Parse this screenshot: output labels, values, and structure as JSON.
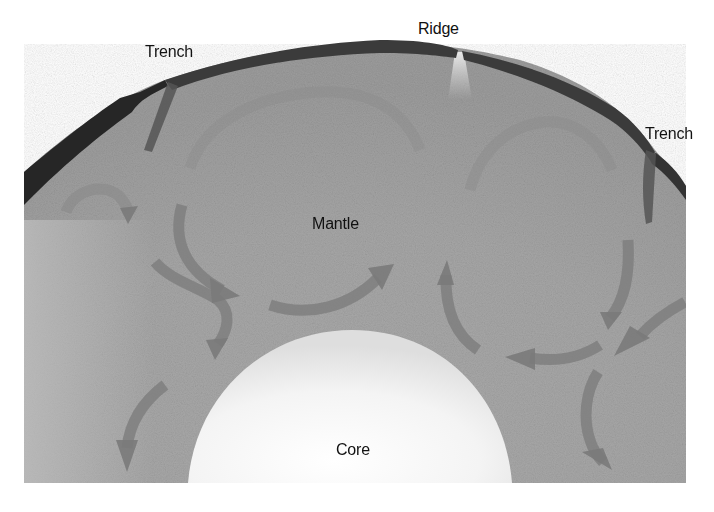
{
  "diagram": {
    "labels": {
      "trench_left": "Trench",
      "ridge": "Ridge",
      "trench_right": "Trench",
      "mantle": "Mantle",
      "core": "Core"
    },
    "colors": {
      "background": "#ffffff",
      "crust": "#3a3a3a",
      "crust_thick": "#262626",
      "mantle": "#a8a8a8",
      "mantle_light": "#bdbdbd",
      "arrow": "#7e7e7e",
      "core": "#f2f2f2",
      "ridge_glow": "#e6e6e6",
      "text": "#111111"
    },
    "features": [
      {
        "id": "left-trench",
        "type": "subduction-zone"
      },
      {
        "id": "ridge",
        "type": "mid-ocean-ridge"
      },
      {
        "id": "right-trench",
        "type": "subduction-zone"
      },
      {
        "id": "left-convection-cell",
        "type": "convection-cell",
        "direction": "counterclockwise"
      },
      {
        "id": "right-convection-cell",
        "type": "convection-cell",
        "direction": "clockwise"
      }
    ]
  }
}
